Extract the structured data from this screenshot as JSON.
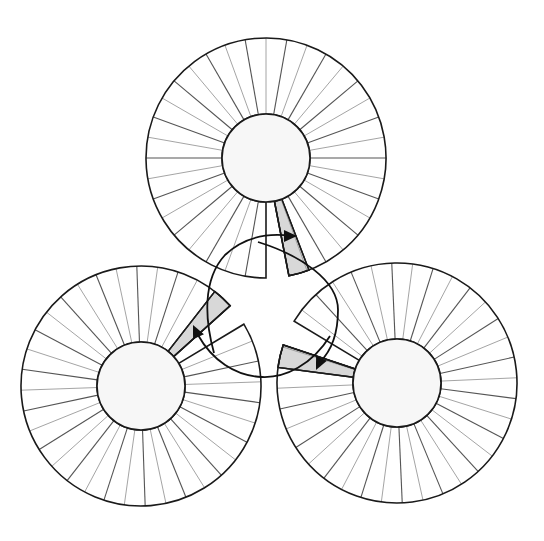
{
  "diagram": {
    "title": "",
    "colors": {
      "background": "#ffffff",
      "outline": "#1a1a1a",
      "hub_fill": "#f7f7f7",
      "highlight_segment": "#d8d8d8",
      "spoke_dark": "#555555",
      "spoke_light": "#9a9a9a",
      "arrow": "#111111"
    },
    "segment_angle_deg": 10,
    "wheels": [
      {
        "id": "wheel-top",
        "cx": 266,
        "cy": 158,
        "outer_r": 120,
        "inner_r": 44,
        "gap_start_deg": 79,
        "gap_end_deg": 90,
        "highlight_start_deg": 69,
        "highlight_end_deg": 79,
        "spoke_offset_deg": 0
      },
      {
        "id": "wheel-bottom-left",
        "cx": 141,
        "cy": 386,
        "outer_r": 120,
        "inner_r": 44,
        "gap_start_deg": -42,
        "gap_end_deg": -31,
        "highlight_start_deg": -52,
        "highlight_end_deg": -42,
        "spoke_offset_deg": 8
      },
      {
        "id": "wheel-bottom-right",
        "cx": 397,
        "cy": 383,
        "outer_r": 120,
        "inner_r": 44,
        "gap_start_deg": 198.5,
        "gap_end_deg": 211,
        "highlight_start_deg": 187.5,
        "highlight_end_deg": 198.5,
        "spoke_offset_deg": 7.5
      }
    ],
    "flow_arrows": [
      {
        "id": "arrow-to-top-wheel",
        "path": "M 214 353 C 205 320, 202 280, 225 255 C 245 236, 270 233, 292 236",
        "head": {
          "x": 297,
          "y": 236,
          "angle_deg": 0
        }
      },
      {
        "id": "arrow-to-bottom-right-wheel",
        "path": "M 258 242 C 300 255, 338 280, 338 310 C 338 335, 330 352, 320 362",
        "head": {
          "x": 316,
          "y": 370,
          "angle_deg": 115
        }
      },
      {
        "id": "arrow-to-bottom-left-wheel",
        "path": "M 330 336 C 312 365, 285 378, 262 377 C 235 376, 212 360, 198 335",
        "head": {
          "x": 193,
          "y": 325,
          "angle_deg": -115
        }
      }
    ]
  }
}
